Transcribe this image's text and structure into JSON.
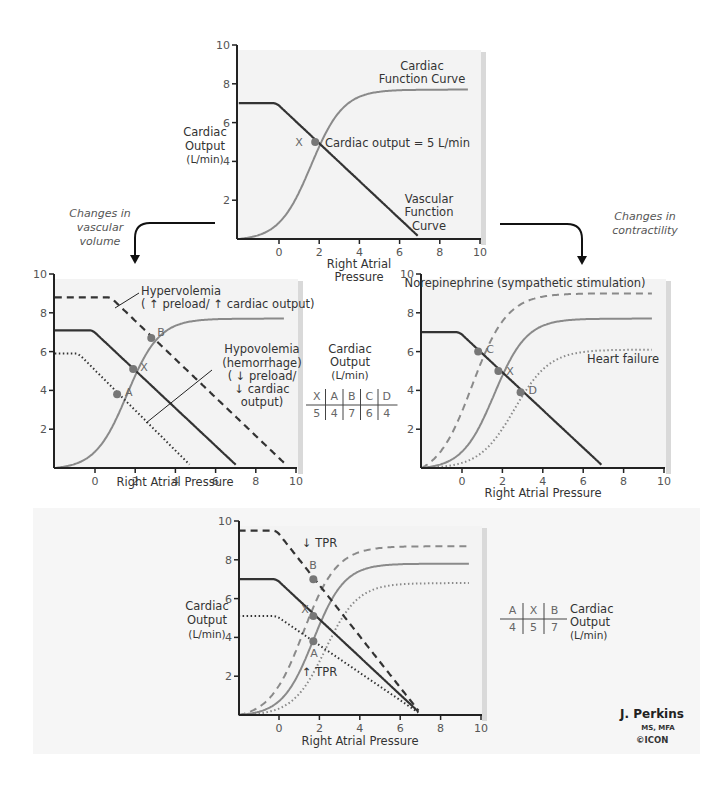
{
  "colors": {
    "vascular": "#333333",
    "cardiac": "#8a8a8a",
    "point": "#777777",
    "panel": "#f3f3f3",
    "panel_shadow": "#d9d9d9",
    "band": "#f6f6f6",
    "axis": "#222222"
  },
  "arrows": {
    "left_label": [
      "Changes in",
      "vascular",
      "volume"
    ],
    "right_label": [
      "Changes in",
      "contractility"
    ]
  },
  "tables": {
    "middle": {
      "title": [
        "Cardiac",
        "Output",
        "(L/min)"
      ],
      "headers": [
        "X",
        "A",
        "B",
        "C",
        "D"
      ],
      "values": [
        "5",
        "4",
        "7",
        "6",
        "4"
      ]
    },
    "bottom": {
      "title": [
        "Cardiac",
        "Output",
        "(L/min)"
      ],
      "headers": [
        "A",
        "X",
        "B"
      ],
      "values": [
        "4",
        "5",
        "7"
      ]
    }
  },
  "signature": {
    "name": "J. Perkins",
    "credentials": "MS, MFA",
    "logo": "©ICON"
  },
  "chart_data": [
    {
      "id": "top",
      "type": "line",
      "title": "",
      "xlabel": "Right Atrial Pressure",
      "ylabel": "Cardiac Output (L/min)",
      "xlim": [
        -2,
        10
      ],
      "ylim": [
        0,
        10
      ],
      "xticks": [
        0,
        2,
        4,
        6,
        8,
        10
      ],
      "yticks": [
        2,
        4,
        6,
        8,
        10
      ],
      "series": [
        {
          "name": "Cardiac Function Curve",
          "kind": "cardiac",
          "style": "solid",
          "plateau": 7.7,
          "mid": 1.6,
          "k": 1.25
        },
        {
          "name": "Vascular Function Curve",
          "kind": "vascular",
          "style": "solid",
          "plateau": 7.0,
          "x0": -0.3,
          "xzero": 6.9
        }
      ],
      "points": [
        {
          "label": "X",
          "x": 1.8,
          "y": 5.0,
          "annotation": "Cardiac output = 5 L/min"
        }
      ],
      "annotations": [
        "Cardiac Function Curve",
        "Vascular Function Curve",
        "Cardiac output = 5 L/min"
      ]
    },
    {
      "id": "volume",
      "type": "line",
      "xlabel": "Right Atrial Pressure",
      "xlim": [
        -2,
        10
      ],
      "ylim": [
        0,
        10
      ],
      "xticks": [
        0,
        2,
        4,
        6,
        8,
        10
      ],
      "yticks": [
        2,
        4,
        6,
        8,
        10
      ],
      "series": [
        {
          "name": "Cardiac function",
          "kind": "cardiac",
          "style": "solid",
          "plateau": 7.7,
          "mid": 1.6,
          "k": 1.25
        },
        {
          "name": "Normal vascular function",
          "kind": "vascular",
          "style": "solid",
          "plateau": 7.1,
          "x0": -0.3,
          "xzero": 7.0
        },
        {
          "name": "Hypervolemia (↑ preload/↑ cardiac output)",
          "kind": "vascular",
          "style": "dashed",
          "plateau": 8.8,
          "x0": 0.6,
          "xzero": 9.5
        },
        {
          "name": "Hypovolemia (hemorrhage) (↓ preload/↓ cardiac output)",
          "kind": "vascular",
          "style": "dotted",
          "plateau": 5.9,
          "x0": -1.0,
          "xzero": 4.7
        }
      ],
      "points": [
        {
          "label": "A",
          "x": 1.1,
          "y": 3.8
        },
        {
          "label": "X",
          "x": 1.9,
          "y": 5.1
        },
        {
          "label": "B",
          "x": 2.8,
          "y": 6.7
        }
      ],
      "annotations": [
        "Hypervolemia",
        "(↑ preload/↑ cardiac output)",
        "Hypovolemia",
        "(hemorrhage)",
        "(↓ preload/",
        "↓ cardiac",
        "output)"
      ]
    },
    {
      "id": "contractility",
      "type": "line",
      "xlabel": "Right Atrial Pressure",
      "xlim": [
        -2,
        10
      ],
      "ylim": [
        0,
        10
      ],
      "xticks": [
        0,
        2,
        4,
        6,
        8,
        10
      ],
      "yticks": [
        2,
        4,
        6,
        8,
        10
      ],
      "series": [
        {
          "name": "Norepinephrine (sympathetic stimulation)",
          "kind": "cardiac",
          "style": "dashed",
          "plateau": 9.0,
          "mid": 0.5,
          "k": 1.15
        },
        {
          "name": "Normal cardiac function",
          "kind": "cardiac",
          "style": "solid",
          "plateau": 7.7,
          "mid": 1.6,
          "k": 1.25
        },
        {
          "name": "Heart failure",
          "kind": "cardiac",
          "style": "dotted",
          "plateau": 6.1,
          "mid": 2.6,
          "k": 1.15
        },
        {
          "name": "Vascular function",
          "kind": "vascular",
          "style": "solid",
          "plateau": 7.0,
          "x0": -0.3,
          "xzero": 6.9
        }
      ],
      "points": [
        {
          "label": "C",
          "x": 0.8,
          "y": 6.0
        },
        {
          "label": "X",
          "x": 1.8,
          "y": 5.0
        },
        {
          "label": "D",
          "x": 2.9,
          "y": 3.9
        }
      ],
      "annotations": [
        "Norepinephrine (sympathetic stimulation)",
        "Heart failure"
      ]
    },
    {
      "id": "tpr",
      "type": "line",
      "xlabel": "Right Atrial Pressure",
      "ylabel": "Cardiac Output (L/min)",
      "xlim": [
        -2,
        10
      ],
      "ylim": [
        0,
        10
      ],
      "xticks": [
        0,
        2,
        4,
        6,
        8,
        10
      ],
      "yticks": [
        2,
        4,
        6,
        8,
        10
      ],
      "series": [
        {
          "name": "Cardiac (↓ TPR)",
          "kind": "cardiac",
          "style": "dashed",
          "plateau": 8.7,
          "mid": 1.2,
          "k": 1.2
        },
        {
          "name": "Cardiac (normal)",
          "kind": "cardiac",
          "style": "solid",
          "plateau": 7.8,
          "mid": 1.7,
          "k": 1.3
        },
        {
          "name": "Cardiac (↑ TPR)",
          "kind": "cardiac",
          "style": "dotted",
          "plateau": 6.8,
          "mid": 2.3,
          "k": 1.25
        },
        {
          "name": "Vascular (↓ TPR)",
          "kind": "vascular",
          "style": "dashed",
          "plateau": 9.5,
          "x0": -0.3,
          "xzero": 6.9
        },
        {
          "name": "Vascular (normal)",
          "kind": "vascular",
          "style": "solid",
          "plateau": 7.0,
          "x0": -0.3,
          "xzero": 6.9
        },
        {
          "name": "Vascular (↑ TPR)",
          "kind": "vascular",
          "style": "dotted",
          "plateau": 5.1,
          "x0": -0.3,
          "xzero": 6.9
        }
      ],
      "points": [
        {
          "label": "B",
          "x": 1.7,
          "y": 7.0
        },
        {
          "label": "X",
          "x": 1.7,
          "y": 5.1
        },
        {
          "label": "A",
          "x": 1.7,
          "y": 3.8
        }
      ],
      "annotations": [
        "↓ TPR",
        "↑ TPR"
      ]
    }
  ],
  "text": {
    "cardiac_output_label": [
      "Cardiac",
      "Output",
      "(L/min)"
    ],
    "top": {
      "cardiac_curve": [
        "Cardiac",
        "Function Curve"
      ],
      "vascular_curve": [
        "Vascular",
        "Function",
        "Curve"
      ],
      "x_label": [
        "Right Atrial",
        "Pressure"
      ],
      "point_note": "Cardiac output = 5 L/min"
    },
    "volume": {
      "hyper": [
        "Hypervolemia",
        "( ↑ preload/ ↑ cardiac output)"
      ],
      "hypo": [
        "Hypovolemia",
        "(hemorrhage)",
        "( ↓ preload/",
        "↓ cardiac",
        "output)"
      ]
    },
    "contractility": {
      "norepi": "Norepinephrine (sympathetic stimulation)",
      "hf": "Heart failure"
    },
    "tpr": {
      "down": "↓ TPR",
      "up": "↑ TPR"
    }
  }
}
